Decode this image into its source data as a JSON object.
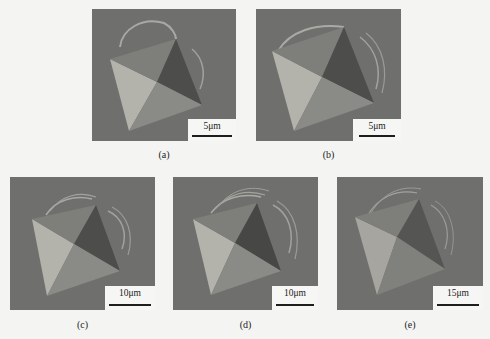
{
  "figure": {
    "panels": [
      {
        "id": "a",
        "caption": "(a)",
        "scale_label": "5μm"
      },
      {
        "id": "b",
        "caption": "(b)",
        "scale_label": "5μm"
      },
      {
        "id": "c",
        "caption": "(c)",
        "scale_label": "10μm"
      },
      {
        "id": "d",
        "caption": "(d)",
        "scale_label": "10μm"
      },
      {
        "id": "e",
        "caption": "(e)",
        "scale_label": "15μm"
      }
    ]
  },
  "colors": {
    "background": "#f4f4f2",
    "surface": "#6f706d",
    "face_light": "#b3b2ab",
    "face_mid": "#8a8a86",
    "face_dark": "#4d4e4b",
    "face_upper": "#7e7f7b"
  }
}
